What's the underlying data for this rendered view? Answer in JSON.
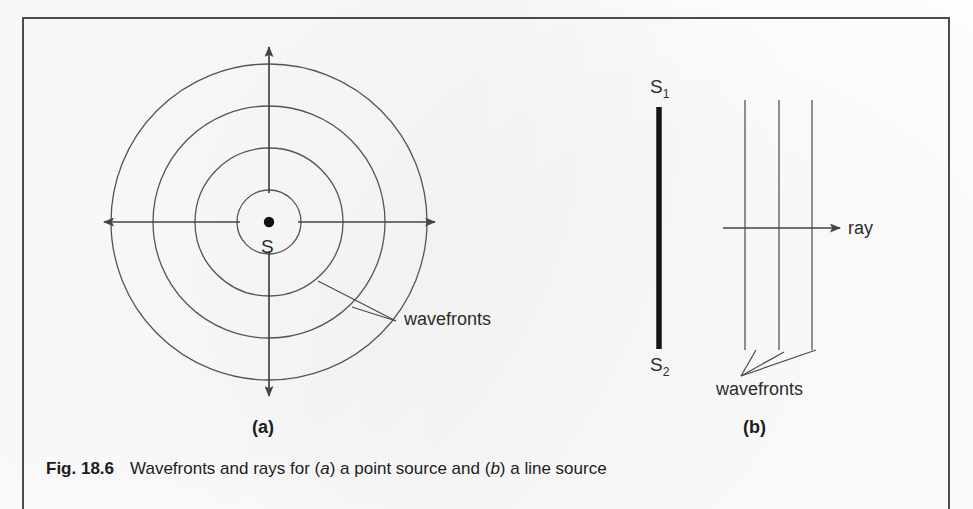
{
  "figure": {
    "number": "Fig. 18.6",
    "caption_parts": {
      "lead": "Wavefronts and rays for (",
      "a_italic": "a",
      "mid": ") a point  source and (",
      "b_italic": "b",
      "tail": ") a line source"
    },
    "caption_plain": "Fig. 18.6   Wavefronts and rays for (a) a point  source and (b) a line source"
  },
  "colors": {
    "ink": "#2b2b2b",
    "ink_dark": "#1c1c1c",
    "frame": "#4b4b4b",
    "line": "#555555",
    "paper": "#fdfdfd"
  },
  "panel_a": {
    "tag": "(a)",
    "source_label": "S",
    "wavefronts_label": "wavefronts",
    "description": "Point source S emitting four concentric circular wavefronts with four rays pointing up, down, left and right",
    "circle_count": 4,
    "circle_radii_px": [
      32,
      74,
      116,
      158
    ],
    "center_px": [
      269,
      222
    ],
    "ray_directions": [
      "up",
      "down",
      "left",
      "right"
    ]
  },
  "panel_b": {
    "tag": "(b)",
    "source_top_label": "S",
    "source_top_sub": "1",
    "source_bottom_label": "S",
    "source_bottom_sub": "2",
    "ray_label": "ray",
    "wavefronts_label": "wavefronts",
    "description": "Line source from S1 to S2 producing three straight parallel plane wavefronts with one horizontal ray",
    "wavefront_count": 3,
    "wavefront_x_px": [
      745,
      779,
      812
    ],
    "source_line_x_px": 659,
    "ray_y_px": 228
  }
}
